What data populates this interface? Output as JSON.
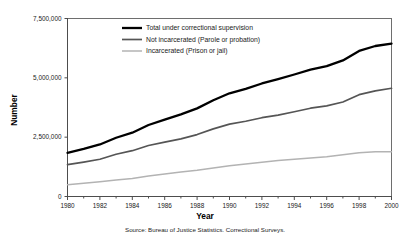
{
  "chart_data": {
    "type": "line",
    "title": "",
    "xlabel": "Year",
    "ylabel": "Number",
    "source": "Source: Bureau of Justice Statistics. Correctional Surveys.",
    "x": [
      1980,
      1981,
      1982,
      1983,
      1984,
      1985,
      1986,
      1987,
      1988,
      1989,
      1990,
      1991,
      1992,
      1993,
      1994,
      1995,
      1996,
      1997,
      1998,
      1999,
      2000
    ],
    "xlim": [
      1980,
      2000
    ],
    "ylim": [
      0,
      7500000
    ],
    "xticks": [
      1980,
      1982,
      1984,
      1986,
      1988,
      1990,
      1992,
      1994,
      1996,
      1998,
      2000
    ],
    "xtick_labels": [
      "1980",
      "1982",
      "1984",
      "1986",
      "1988",
      "1990",
      "1992",
      "1994",
      "1996",
      "1998",
      "2000"
    ],
    "yticks": [
      0,
      2500000,
      5000000,
      7500000
    ],
    "ytick_labels": [
      "0",
      "2,500,000",
      "5,000,000",
      "7,500,000"
    ],
    "grid": false,
    "legend_position": "upper-left-inside",
    "series": [
      {
        "name": "Total under correctional supervision",
        "color": "#000000",
        "width": 2.3,
        "values": [
          1840400,
          2006600,
          2192300,
          2475100,
          2689200,
          3011500,
          3239400,
          3459600,
          3714100,
          4055300,
          4348000,
          4536200,
          4762600,
          4944000,
          5141300,
          5342900,
          5490700,
          5734900,
          6134200,
          6340800,
          6445100
        ]
      },
      {
        "name": "Not incarcerated (Parole or probation)",
        "color": "#555555",
        "width": 1.7,
        "values": [
          1340000,
          1450000,
          1570000,
          1780000,
          1930000,
          2150000,
          2290000,
          2430000,
          2610000,
          2850000,
          3050000,
          3170000,
          3320000,
          3430000,
          3570000,
          3720000,
          3820000,
          3980000,
          4290000,
          4450000,
          4560000
        ]
      },
      {
        "name": "Incarcerated (Prison or jail)",
        "color": "#b3b3b3",
        "width": 1.5,
        "values": [
          500000,
          556600,
          622300,
          695100,
          759200,
          861500,
          949400,
          1029600,
          1104100,
          1205300,
          1298000,
          1366200,
          1442600,
          1514000,
          1571300,
          1622900,
          1670700,
          1754900,
          1844200,
          1890800,
          1885100
        ]
      }
    ]
  },
  "legend": {
    "items": [
      {
        "label": "Total under correctional supervision"
      },
      {
        "label": "Not incarcerated (Parole or probation)"
      },
      {
        "label": "Incarcerated (Prison or jail)"
      }
    ]
  }
}
